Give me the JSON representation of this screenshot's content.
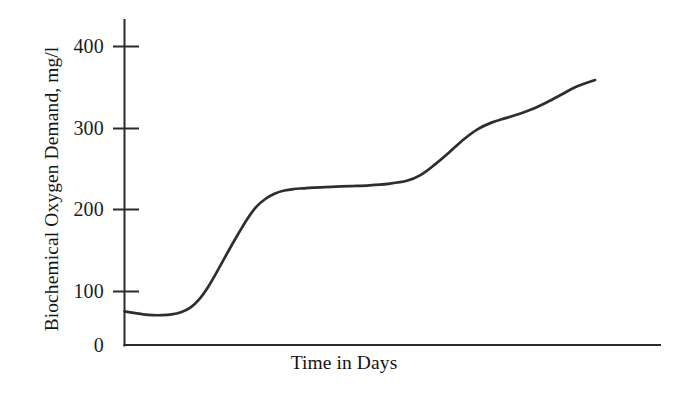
{
  "chart_data": {
    "type": "line",
    "title": "",
    "subtitle": "",
    "xlabel": "Time in Days",
    "ylabel": "Biochemical Oxygen Demand, mg/l",
    "grid": false,
    "legend": null,
    "line_color": "#2e2e2e",
    "axis_color": "#2b2b2b",
    "background_color": "#ffffff",
    "xlim": [
      0,
      100
    ],
    "ylim": [
      0,
      430
    ],
    "x_tick_labels": [],
    "y_tick_labels": [
      "400",
      "300",
      "200",
      "100",
      "0"
    ],
    "y_ticks": [
      400,
      300,
      200,
      100,
      0
    ],
    "annotations": [],
    "series": [
      {
        "name": "Biochemical Oxygen Demand",
        "x": [
          0,
          2,
          4,
          6,
          8,
          10,
          12,
          14,
          16,
          18,
          20,
          22,
          24,
          26,
          28,
          30,
          32,
          34,
          36,
          38,
          40,
          44,
          48,
          52,
          56,
          60,
          63,
          66,
          69,
          72,
          75,
          78,
          81,
          84,
          87,
          90,
          93,
          96,
          100
        ],
        "y": [
          45,
          43,
          41,
          40,
          40,
          41,
          44,
          50,
          62,
          80,
          102,
          125,
          147,
          168,
          185,
          196,
          203,
          207,
          209,
          210,
          211,
          212,
          213,
          214,
          216,
          220,
          228,
          242,
          258,
          275,
          289,
          298,
          304,
          310,
          317,
          326,
          336,
          346,
          355
        ]
      }
    ]
  },
  "axes": {
    "y_tick_400": "400",
    "y_tick_300": "300",
    "y_tick_200": "200",
    "y_tick_100": "100",
    "y_tick_0": "0",
    "y_title": "Biochemical Oxygen Demand, mg/l",
    "x_title": "Time in Days"
  }
}
